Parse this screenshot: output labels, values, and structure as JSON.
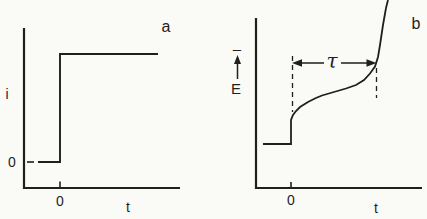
{
  "figure": {
    "description_visible_text_only": "",
    "ink_color": "#1f1f1f",
    "paper_color": "#fafaf7"
  },
  "chart_data": [
    {
      "id": "a",
      "type": "line",
      "corner_label": "a",
      "xlabel": "t",
      "ylabel": "i",
      "x_ticks": [
        {
          "value": 0,
          "label": "0"
        }
      ],
      "y_ticks": [
        {
          "value": 0,
          "label": "0"
        }
      ],
      "xlim": [
        -0.37,
        1.22
      ],
      "ylim": [
        -0.25,
        1.25
      ],
      "grid": false,
      "legend": "none",
      "series": [
        {
          "points": [
            [
              -0.224,
              0
            ],
            [
              0,
              0
            ],
            [
              0,
              1
            ],
            [
              1,
              1
            ]
          ]
        }
      ]
    },
    {
      "id": "b",
      "type": "line",
      "corner_label": "b",
      "xlabel": "t",
      "ylabel": "E",
      "ylabel_sign": "–",
      "ylabel_arrow": "up",
      "x_ticks": [
        {
          "value": 0,
          "label": "0"
        }
      ],
      "y_ticks": [],
      "xlim": [
        -0.41,
        1.52
      ],
      "ylim": [
        -0.56,
        1.56
      ],
      "grid": false,
      "legend": "none",
      "annotations": {
        "tau_label": "τ",
        "tau_span_t": [
          0,
          1
        ],
        "dashed_guides_t": [
          0,
          1
        ]
      },
      "series": [
        {
          "points": [
            [
              -0.326,
              0
            ],
            [
              0,
              0
            ],
            [
              0,
              0.3
            ],
            [
              0.023,
              0.363
            ],
            [
              0.058,
              0.413
            ],
            [
              0.105,
              0.463
            ],
            [
              0.198,
              0.525
            ],
            [
              0.29,
              0.575
            ],
            [
              0.36,
              0.606
            ],
            [
              0.5,
              0.65
            ],
            [
              0.64,
              0.694
            ],
            [
              0.756,
              0.738
            ],
            [
              0.849,
              0.8
            ],
            [
              0.919,
              0.881
            ],
            [
              0.977,
              0.969
            ],
            [
              1.012,
              1.088
            ],
            [
              1.035,
              1.238
            ],
            [
              1.07,
              1.488
            ],
            [
              1.105,
              1.7
            ],
            [
              1.128,
              1.8
            ]
          ]
        }
      ]
    }
  ]
}
